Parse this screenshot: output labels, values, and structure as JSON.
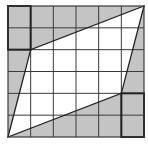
{
  "diagram": {
    "type": "grid-parallelogram",
    "grid": {
      "rows": 6,
      "cols": 6,
      "x0": 8,
      "y0": 6,
      "x1": 144,
      "y1": 137
    },
    "colors": {
      "shade": "#c4c4c4",
      "white": "#ffffff",
      "line": "#3a3a3a",
      "bold": "#222222"
    },
    "parallelogram": {
      "vertices_grid": [
        [
          0,
          6
        ],
        [
          1,
          2
        ],
        [
          6,
          0
        ],
        [
          5,
          4
        ]
      ],
      "fill": "white"
    },
    "bold_rects": [
      {
        "col": 0,
        "row": 0,
        "w": 1,
        "h": 2
      },
      {
        "col": 5,
        "row": 4,
        "w": 1,
        "h": 2
      }
    ]
  }
}
